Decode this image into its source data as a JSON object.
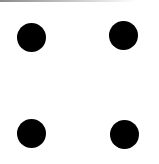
{
  "die": {
    "face_value": 4,
    "background_color": "#ffffff",
    "pip_color": "#000000",
    "pips": [
      {
        "name": "pip-top-left",
        "cx": 31,
        "cy": 37,
        "r": 14.5
      },
      {
        "name": "pip-top-right",
        "cx": 123,
        "cy": 35,
        "r": 14.5
      },
      {
        "name": "pip-bottom-left",
        "cx": 31,
        "cy": 133,
        "r": 14.5
      },
      {
        "name": "pip-bottom-right",
        "cx": 124,
        "cy": 134,
        "r": 14.5
      }
    ]
  }
}
